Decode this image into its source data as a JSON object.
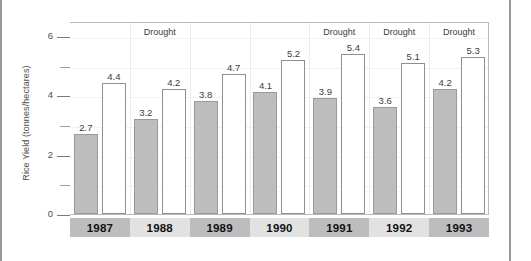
{
  "chart_data": {
    "type": "bar",
    "title": "",
    "subtitle": "",
    "xlabel": "",
    "ylabel": "Rice Yield (tonnes/hectares)",
    "ylim": [
      0,
      6.5
    ],
    "yticks": [
      0,
      2,
      4,
      6
    ],
    "yticklabels": [
      "0",
      "2",
      "4",
      "6"
    ],
    "yminorticks": [
      1,
      3,
      5
    ],
    "grid": "faint-vertical-separators",
    "legend": "none",
    "categories": [
      "1987",
      "1988",
      "1989",
      "1990",
      "1991",
      "1992",
      "1993"
    ],
    "series": [
      {
        "name": "gray-bar",
        "values": [
          2.7,
          3.2,
          3.8,
          4.1,
          3.9,
          3.6,
          4.2
        ],
        "labels": [
          "2.7",
          "3.2",
          "3.8",
          "4.1",
          "3.9",
          "3.6",
          "4.2"
        ],
        "color": "#bdbdbd"
      },
      {
        "name": "white-bar",
        "values": [
          4.4,
          4.2,
          4.7,
          5.2,
          5.4,
          5.1,
          5.3
        ],
        "labels": [
          "4.4",
          "4.2",
          "4.7",
          "5.2",
          "5.4",
          "5.1",
          "5.3"
        ],
        "color": "#ffffff"
      }
    ],
    "annotations": [
      {
        "text": "Drought",
        "category": "1988"
      },
      {
        "text": "Drought",
        "category": "1991"
      },
      {
        "text": "Drought",
        "category": "1992"
      },
      {
        "text": "Drought",
        "category": "1993"
      }
    ],
    "category_band_colors": [
      "#bdbdbd",
      "#e2e2e2",
      "#bdbdbd",
      "#e2e2e2",
      "#bdbdbd",
      "#e2e2e2",
      "#bdbdbd"
    ]
  }
}
